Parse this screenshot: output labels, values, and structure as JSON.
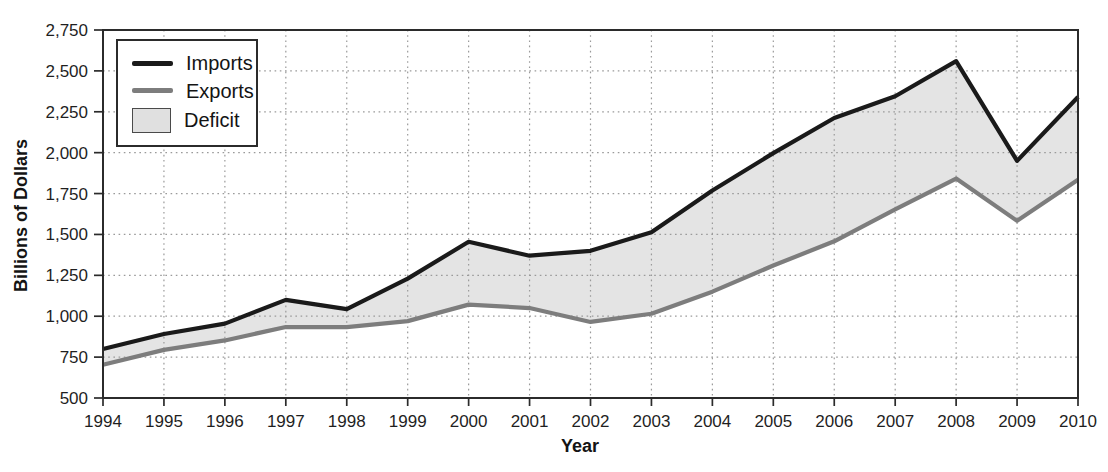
{
  "chart_data": {
    "type": "area",
    "title": "",
    "xlabel": "Year",
    "ylabel": "Billions of Dollars",
    "x": [
      "1994",
      "1995",
      "1996",
      "1997",
      "1998",
      "1999",
      "2000",
      "2001",
      "2002",
      "2003",
      "2004",
      "2005",
      "2006",
      "2007",
      "2008",
      "2009",
      "2010"
    ],
    "series": [
      {
        "name": "Imports",
        "color": "#1a1a1a",
        "values": [
          800,
          891,
          955,
          1100,
          1043,
          1230,
          1455,
          1370,
          1400,
          1514,
          1769,
          1997,
          2212,
          2345,
          2560,
          1950,
          2340
        ]
      },
      {
        "name": "Exports",
        "color": "#7d7d7d",
        "values": [
          703,
          794,
          852,
          934,
          933,
          970,
          1071,
          1050,
          965,
          1015,
          1150,
          1310,
          1458,
          1653,
          1842,
          1583,
          1835
        ]
      }
    ],
    "area": {
      "name": "Deficit",
      "between": [
        "Imports",
        "Exports"
      ],
      "fill": "#e4e4e4"
    },
    "ylim": [
      500,
      2750
    ],
    "yticks": [
      500,
      750,
      1000,
      1250,
      1500,
      1750,
      2000,
      2250,
      2500,
      2750
    ],
    "ytick_labels": [
      "500",
      "750",
      "1,000",
      "1,250",
      "1,500",
      "1,750",
      "2,000",
      "2,250",
      "2,500",
      "2,750"
    ],
    "grid": "dotted",
    "frame": true,
    "legend_position": "top-left",
    "colors": {
      "grid": "#9a9a9a",
      "frame": "#2b2b2b",
      "text": "#1f1f1f",
      "background": "#ffffff"
    }
  },
  "axes": {
    "x_title": "Year",
    "y_title": "Billions of Dollars"
  },
  "legend": {
    "items": [
      {
        "label": "Imports",
        "swatch": "line",
        "color": "#1a1a1a"
      },
      {
        "label": "Exports",
        "swatch": "line",
        "color": "#7d7d7d"
      },
      {
        "label": "Deficit",
        "swatch": "box",
        "color": "#e0e0e0"
      }
    ]
  }
}
